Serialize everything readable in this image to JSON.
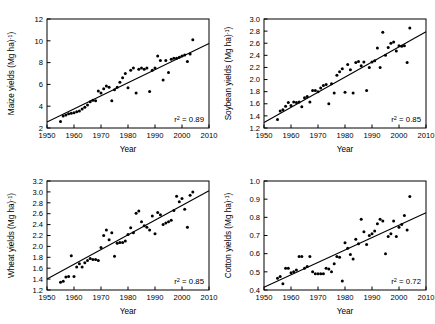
{
  "figure": {
    "type": "multi-panel-scatter",
    "panel_count": 4,
    "layout": "2x2",
    "background": "#ffffff",
    "marker_color": "#000000",
    "line_color": "#000000"
  },
  "chart_data": [
    {
      "id": "maize",
      "type": "scatter",
      "title": "",
      "xlabel": "Year",
      "ylabel": "Maize yields (Mg ha⁻¹)",
      "ylabel_plain": "Maize yields (Mg ha-1)",
      "xlim": [
        1950,
        2010
      ],
      "ylim": [
        2,
        12
      ],
      "xticks": [
        1950,
        1960,
        1970,
        1980,
        1990,
        2000,
        2010
      ],
      "yticks": [
        2,
        4,
        6,
        8,
        10,
        12
      ],
      "xtick_labels": [
        "1950",
        "1960",
        "1970",
        "1980",
        "1990",
        "2000",
        "2010"
      ],
      "ytick_labels": [
        "2",
        "4",
        "6",
        "8",
        "10",
        "12"
      ],
      "grid": false,
      "legend": false,
      "annotation": "r2 = 0.89",
      "annotation_base": "r",
      "annotation_sup": "2",
      "annotation_rest": " = 0.89",
      "r2": 0.89,
      "trendline": {
        "x": [
          1950,
          2010
        ],
        "y": [
          2.55,
          9.75
        ]
      },
      "x": [
        1955,
        1956,
        1957,
        1958,
        1959,
        1960,
        1961,
        1962,
        1963,
        1964,
        1965,
        1966,
        1967,
        1968,
        1969,
        1970,
        1971,
        1972,
        1973,
        1974,
        1975,
        1976,
        1977,
        1978,
        1979,
        1980,
        1981,
        1982,
        1983,
        1984,
        1985,
        1986,
        1987,
        1988,
        1989,
        1990,
        1991,
        1992,
        1993,
        1994,
        1995,
        1996,
        1997,
        1998,
        1999,
        2000,
        2001,
        2002,
        2003,
        2004
      ],
      "y": [
        2.6,
        3.1,
        3.2,
        3.3,
        3.35,
        3.4,
        3.5,
        3.55,
        3.75,
        3.9,
        4.1,
        4.4,
        4.55,
        4.5,
        5.4,
        5.2,
        5.6,
        5.85,
        5.75,
        4.5,
        5.5,
        5.75,
        6.2,
        6.6,
        7.0,
        5.7,
        7.3,
        7.5,
        5.2,
        7.4,
        7.5,
        7.4,
        7.5,
        5.35,
        7.3,
        7.5,
        8.6,
        8.2,
        6.4,
        8.2,
        7.1,
        8.3,
        8.4,
        8.4,
        8.5,
        8.6,
        8.7,
        8.1,
        8.8,
        10.1
      ]
    },
    {
      "id": "soybean",
      "type": "scatter",
      "title": "",
      "xlabel": "Year",
      "ylabel": "Soybean yields (Mg ha⁻¹)",
      "ylabel_plain": "Soybean yields (Mg ha-1)",
      "xlim": [
        1950,
        2010
      ],
      "ylim": [
        1.2,
        3.0
      ],
      "xticks": [
        1950,
        1960,
        1970,
        1980,
        1990,
        2000,
        2010
      ],
      "yticks": [
        1.2,
        1.4,
        1.6,
        1.8,
        2.0,
        2.2,
        2.4,
        2.6,
        2.8,
        3.0
      ],
      "xtick_labels": [
        "1950",
        "1960",
        "1970",
        "1980",
        "1990",
        "2000",
        "2010"
      ],
      "ytick_labels": [
        "1.2",
        "1.4",
        "1.6",
        "1.8",
        "2.0",
        "2.2",
        "2.4",
        "2.6",
        "2.8",
        "3.0"
      ],
      "grid": false,
      "legend": false,
      "annotation": "r2 = 0.85",
      "annotation_base": "r",
      "annotation_sup": "2",
      "annotation_rest": " = 0.85",
      "r2": 0.85,
      "trendline": {
        "x": [
          1950,
          2010
        ],
        "y": [
          1.29,
          2.79
        ]
      },
      "x": [
        1955,
        1956,
        1957,
        1958,
        1959,
        1960,
        1961,
        1962,
        1963,
        1964,
        1965,
        1966,
        1967,
        1968,
        1969,
        1970,
        1971,
        1972,
        1973,
        1974,
        1975,
        1976,
        1977,
        1978,
        1979,
        1980,
        1981,
        1982,
        1983,
        1984,
        1985,
        1986,
        1987,
        1988,
        1989,
        1990,
        1991,
        1992,
        1993,
        1994,
        1995,
        1996,
        1997,
        1998,
        1999,
        2000,
        2001,
        2002,
        2003,
        2004
      ],
      "y": [
        1.34,
        1.48,
        1.5,
        1.56,
        1.62,
        1.57,
        1.63,
        1.62,
        1.63,
        1.55,
        1.7,
        1.72,
        1.63,
        1.82,
        1.82,
        1.8,
        1.86,
        1.9,
        1.92,
        1.6,
        1.93,
        1.78,
        2.07,
        2.13,
        2.18,
        1.79,
        2.25,
        2.16,
        1.78,
        2.28,
        2.3,
        2.23,
        2.29,
        1.82,
        2.2,
        2.29,
        2.31,
        2.52,
        2.2,
        2.78,
        2.4,
        2.53,
        2.6,
        2.62,
        2.47,
        2.56,
        2.55,
        2.56,
        2.28,
        2.85
      ]
    },
    {
      "id": "wheat",
      "type": "scatter",
      "title": "",
      "xlabel": "Year",
      "ylabel": "Wheat yields (Mg ha⁻¹)",
      "ylabel_plain": "Wheat yields (Mg ha-1)",
      "xlim": [
        1950,
        2010
      ],
      "ylim": [
        1.2,
        3.2
      ],
      "xticks": [
        1950,
        1960,
        1970,
        1980,
        1990,
        2000,
        2010
      ],
      "yticks": [
        1.2,
        1.4,
        1.6,
        1.8,
        2.0,
        2.2,
        2.4,
        2.6,
        2.8,
        3.0,
        3.2
      ],
      "xtick_labels": [
        "1950",
        "1960",
        "1970",
        "1980",
        "1990",
        "2000",
        "2010"
      ],
      "ytick_labels": [
        "1.2",
        "1.4",
        "1.6",
        "1.8",
        "2.0",
        "2.2",
        "2.4",
        "2.6",
        "2.8",
        "3.0",
        "3.2"
      ],
      "grid": false,
      "legend": false,
      "annotation": "r2 = 0.85",
      "annotation_base": "r",
      "annotation_sup": "2",
      "annotation_rest": " = 0.85",
      "r2": 0.85,
      "trendline": {
        "x": [
          1950,
          2010
        ],
        "y": [
          1.4,
          3.02
        ]
      },
      "x": [
        1955,
        1956,
        1957,
        1958,
        1959,
        1960,
        1961,
        1962,
        1963,
        1964,
        1965,
        1966,
        1967,
        1968,
        1969,
        1970,
        1971,
        1972,
        1973,
        1974,
        1975,
        1976,
        1977,
        1978,
        1979,
        1980,
        1981,
        1982,
        1983,
        1984,
        1985,
        1986,
        1987,
        1988,
        1989,
        1990,
        1991,
        1992,
        1993,
        1994,
        1995,
        1996,
        1997,
        1998,
        1999,
        2000,
        2001,
        2002,
        2003,
        2004
      ],
      "y": [
        1.34,
        1.36,
        1.44,
        1.45,
        1.83,
        1.45,
        1.62,
        1.68,
        1.62,
        1.7,
        1.74,
        1.78,
        1.76,
        1.76,
        1.74,
        1.98,
        2.2,
        2.3,
        2.12,
        2.25,
        1.82,
        2.06,
        2.07,
        2.07,
        2.1,
        2.22,
        2.34,
        2.25,
        2.61,
        2.65,
        2.45,
        2.38,
        2.35,
        2.3,
        2.56,
        2.23,
        2.62,
        2.58,
        2.4,
        2.43,
        2.45,
        2.48,
        2.66,
        2.92,
        2.82,
        2.88,
        2.68,
        2.35,
        2.94,
        3.0
      ]
    },
    {
      "id": "cotton",
      "type": "scatter",
      "title": "",
      "xlabel": "Year",
      "ylabel": "Cotton yields (Mg ha⁻¹)",
      "ylabel_plain": "Cotton yields (Mg ha-1)",
      "xlim": [
        1950,
        2010
      ],
      "ylim": [
        0.4,
        1.0
      ],
      "xticks": [
        1950,
        1960,
        1970,
        1980,
        1990,
        2000,
        2010
      ],
      "yticks": [
        0.4,
        0.5,
        0.6,
        0.7,
        0.8,
        0.9,
        1.0
      ],
      "xtick_labels": [
        "1950",
        "1960",
        "1970",
        "1980",
        "1990",
        "2000",
        "2010"
      ],
      "ytick_labels": [
        "0.4",
        "0.5",
        "0.6",
        "0.7",
        "0.8",
        "0.9",
        "1.0"
      ],
      "grid": false,
      "legend": false,
      "annotation": "r2 = 0.72",
      "annotation_base": "r",
      "annotation_sup": "2",
      "annotation_rest": " = 0.72",
      "r2": 0.72,
      "trendline": {
        "x": [
          1950,
          2010
        ],
        "y": [
          0.415,
          0.825
        ]
      },
      "x": [
        1955,
        1956,
        1957,
        1958,
        1959,
        1960,
        1961,
        1962,
        1963,
        1964,
        1965,
        1966,
        1967,
        1968,
        1969,
        1970,
        1971,
        1972,
        1973,
        1974,
        1975,
        1976,
        1977,
        1978,
        1979,
        1980,
        1981,
        1982,
        1983,
        1984,
        1985,
        1986,
        1987,
        1988,
        1989,
        1990,
        1991,
        1992,
        1993,
        1994,
        1995,
        1996,
        1997,
        1998,
        1999,
        2000,
        2001,
        2002,
        2003,
        2004
      ],
      "y": [
        0.465,
        0.475,
        0.435,
        0.52,
        0.52,
        0.495,
        0.5,
        0.51,
        0.585,
        0.585,
        0.52,
        0.53,
        0.585,
        0.5,
        0.49,
        0.49,
        0.49,
        0.49,
        0.52,
        0.515,
        0.5,
        0.545,
        0.585,
        0.58,
        0.45,
        0.66,
        0.63,
        0.595,
        0.57,
        0.68,
        0.655,
        0.79,
        0.72,
        0.65,
        0.7,
        0.71,
        0.725,
        0.765,
        0.79,
        0.78,
        0.6,
        0.695,
        0.71,
        0.78,
        0.695,
        0.745,
        0.76,
        0.81,
        0.73,
        0.915
      ]
    }
  ]
}
